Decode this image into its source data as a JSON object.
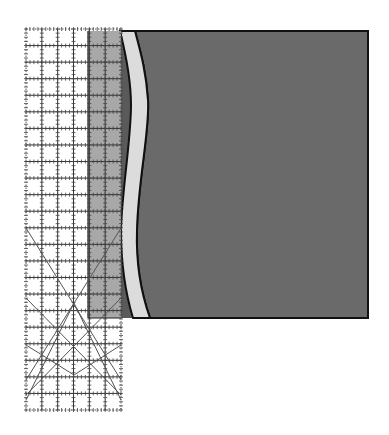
{
  "illustration": {
    "subject": "quilting ruler over fabric with curved seam",
    "colors": {
      "background": "#ffffff",
      "fabric": "#6a6a6a",
      "fabric_outline": "#111111",
      "seam_strip": "#dcdcdc",
      "ruler_overlap_shade": "#a8a8a8",
      "ruler_grid": "#333333",
      "ruler_diagonals": "#555555"
    },
    "ruler": {
      "x": 26,
      "y": 29,
      "width": 95,
      "height": 381,
      "columns": 6,
      "rows": 23
    },
    "fabric": {
      "x": 120,
      "y": 31,
      "right": 368,
      "bottom": 318
    },
    "overlap_shade": {
      "x": 88,
      "y": 31,
      "width": 33,
      "height": 287
    }
  }
}
